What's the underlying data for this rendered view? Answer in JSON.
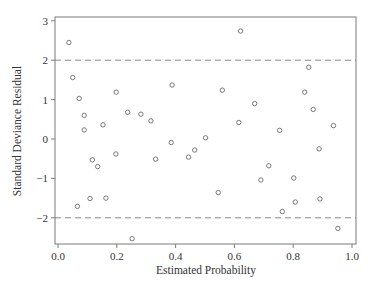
{
  "chart_data": {
    "type": "scatter",
    "title": "",
    "xlabel": "Estimated Probability",
    "ylabel": "Standard Deviance Residual",
    "xlim": [
      -0.01,
      1.02
    ],
    "ylim": [
      -2.65,
      3.07
    ],
    "xticks": [
      0.0,
      0.2,
      0.4,
      0.6,
      0.8,
      1.0
    ],
    "xtick_labels": [
      "0.0",
      "0.2",
      "0.4",
      "0.6",
      "0.8",
      "1.0"
    ],
    "yticks": [
      -2,
      -1,
      0,
      1,
      2,
      3
    ],
    "ytick_labels": [
      "−2",
      "−1",
      "0",
      "1",
      "2",
      "3"
    ],
    "grid": false,
    "legend": null,
    "reference_lines": [
      {
        "axis": "y",
        "value": 2,
        "style": "dashed"
      },
      {
        "axis": "y",
        "value": -2,
        "style": "dashed"
      }
    ],
    "marker": "open-circle",
    "points": [
      {
        "x": 0.037,
        "y": 2.45
      },
      {
        "x": 0.05,
        "y": 1.56
      },
      {
        "x": 0.066,
        "y": -1.71
      },
      {
        "x": 0.072,
        "y": 1.03
      },
      {
        "x": 0.089,
        "y": 0.6
      },
      {
        "x": 0.089,
        "y": 0.23
      },
      {
        "x": 0.109,
        "y": -1.51
      },
      {
        "x": 0.117,
        "y": -0.53
      },
      {
        "x": 0.135,
        "y": -0.7
      },
      {
        "x": 0.153,
        "y": 0.36
      },
      {
        "x": 0.163,
        "y": -1.5
      },
      {
        "x": 0.197,
        "y": -0.38
      },
      {
        "x": 0.198,
        "y": 1.19
      },
      {
        "x": 0.237,
        "y": 0.68
      },
      {
        "x": 0.252,
        "y": -2.53
      },
      {
        "x": 0.282,
        "y": 0.63
      },
      {
        "x": 0.316,
        "y": 0.46
      },
      {
        "x": 0.332,
        "y": -0.51
      },
      {
        "x": 0.385,
        "y": -0.09
      },
      {
        "x": 0.388,
        "y": 1.37
      },
      {
        "x": 0.444,
        "y": -0.46
      },
      {
        "x": 0.465,
        "y": -0.28
      },
      {
        "x": 0.502,
        "y": 0.03
      },
      {
        "x": 0.545,
        "y": -1.36
      },
      {
        "x": 0.559,
        "y": 1.24
      },
      {
        "x": 0.615,
        "y": 0.42
      },
      {
        "x": 0.621,
        "y": 2.74
      },
      {
        "x": 0.669,
        "y": 0.9
      },
      {
        "x": 0.69,
        "y": -1.04
      },
      {
        "x": 0.717,
        "y": -0.68
      },
      {
        "x": 0.754,
        "y": 0.22
      },
      {
        "x": 0.763,
        "y": -1.84
      },
      {
        "x": 0.802,
        "y": -0.99
      },
      {
        "x": 0.807,
        "y": -1.6
      },
      {
        "x": 0.839,
        "y": 1.19
      },
      {
        "x": 0.853,
        "y": 1.82
      },
      {
        "x": 0.868,
        "y": 0.75
      },
      {
        "x": 0.888,
        "y": -0.25
      },
      {
        "x": 0.891,
        "y": -1.52
      },
      {
        "x": 0.937,
        "y": 0.34
      },
      {
        "x": 0.952,
        "y": -2.27
      }
    ]
  },
  "style": {
    "frame_color": "#7a7a7a",
    "marker_color": "#6a6a6a",
    "refline_color": "#8a8a8a",
    "text_color": "#333333"
  }
}
